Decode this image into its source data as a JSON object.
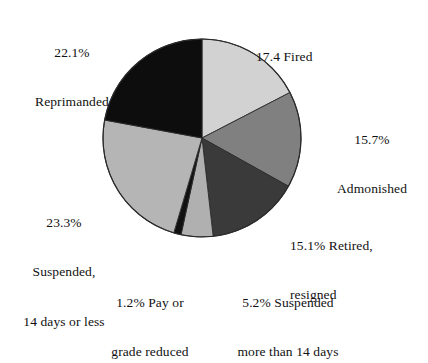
{
  "chart_data": {
    "type": "pie",
    "title": "",
    "subtitle": "",
    "xlabel": "",
    "ylabel": "",
    "legend_position": "none",
    "grid": false,
    "start_angle_deg": 0,
    "direction": "clockwise",
    "categories": [
      "Fired",
      "Admonished",
      "Retired, resigned",
      "Suspended more than 14 days",
      "Pay or grade reduced",
      "Suspended, 14 days or less",
      "Reprimanded"
    ],
    "values": [
      17.4,
      15.7,
      15.1,
      5.2,
      1.2,
      23.3,
      22.1
    ],
    "value_unit": "percent",
    "slices": [
      {
        "label": "Fired",
        "value": 17.4,
        "value_text": "17.4",
        "color": "#d2d2d2"
      },
      {
        "label": "Admonished",
        "value": 15.7,
        "value_text": "15.7%",
        "color": "#808080"
      },
      {
        "label": "Retired, resigned",
        "value": 15.1,
        "value_text": "15.1%",
        "color": "#3a3a3a"
      },
      {
        "label": "Suspended more than 14 days",
        "value": 5.2,
        "value_text": "5.2%",
        "color": "#b0b0b0"
      },
      {
        "label": "Pay or grade reduced",
        "value": 1.2,
        "value_text": "1.2%",
        "color": "#111111"
      },
      {
        "label": "Suspended, 14 days or less",
        "value": 23.3,
        "value_text": "23.3%",
        "color": "#b5b5b5"
      },
      {
        "label": "Reprimanded",
        "value": 22.1,
        "value_text": "22.1%",
        "color": "#0d0d0d"
      }
    ]
  },
  "labels": {
    "reprimanded": {
      "line1": "22.1%",
      "line2": "Reprimanded"
    },
    "fired": {
      "line1": "17.4 Fired"
    },
    "admonished": {
      "line1": "15.7%",
      "line2": "Admonished"
    },
    "retired": {
      "line1": "15.1% Retired,",
      "line2": "resigned"
    },
    "suspended_more": {
      "line1": "5.2% Suspended",
      "line2": "more than 14 days"
    },
    "pay_grade": {
      "line1": "1.2% Pay or",
      "line2": "grade reduced"
    },
    "suspended_less": {
      "line1": "23.3%",
      "line2": "Suspended,",
      "line3": "14 days or less"
    }
  },
  "colors": {
    "background": "#ffffff",
    "text": "#111111",
    "outline": "#2b2b2b"
  }
}
